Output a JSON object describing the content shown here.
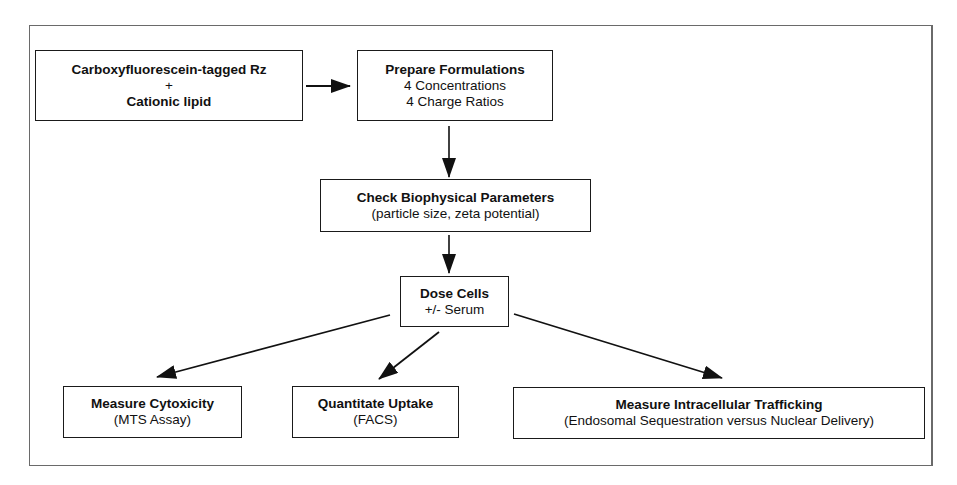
{
  "diagram": {
    "nodes": {
      "input": {
        "line1": "Carboxyfluorescein-tagged Rz",
        "line2": "+",
        "line3": "Cationic lipid"
      },
      "prepare": {
        "title": "Prepare Formulations",
        "line2": "4 Concentrations",
        "line3": "4 Charge Ratios"
      },
      "check": {
        "title": "Check Biophysical Parameters",
        "line2": "(particle size, zeta potential)"
      },
      "dose": {
        "title": "Dose Cells",
        "line2": "+/- Serum"
      },
      "cytotoxicity": {
        "title": "Measure Cytoxicity",
        "line2": "(MTS Assay)"
      },
      "uptake": {
        "title": "Quantitate Uptake",
        "line2": "(FACS)"
      },
      "trafficking": {
        "title": "Measure Intracellular Trafficking",
        "line2": "(Endosomal Sequestration versus Nuclear Delivery)"
      }
    },
    "edges": [
      {
        "from": "input",
        "to": "prepare"
      },
      {
        "from": "prepare",
        "to": "check"
      },
      {
        "from": "check",
        "to": "dose"
      },
      {
        "from": "dose",
        "to": "cytotoxicity"
      },
      {
        "from": "dose",
        "to": "uptake"
      },
      {
        "from": "dose",
        "to": "trafficking"
      }
    ],
    "colors": {
      "line": "#111111",
      "frame": "#6a6a6a",
      "background": "#ffffff"
    }
  }
}
